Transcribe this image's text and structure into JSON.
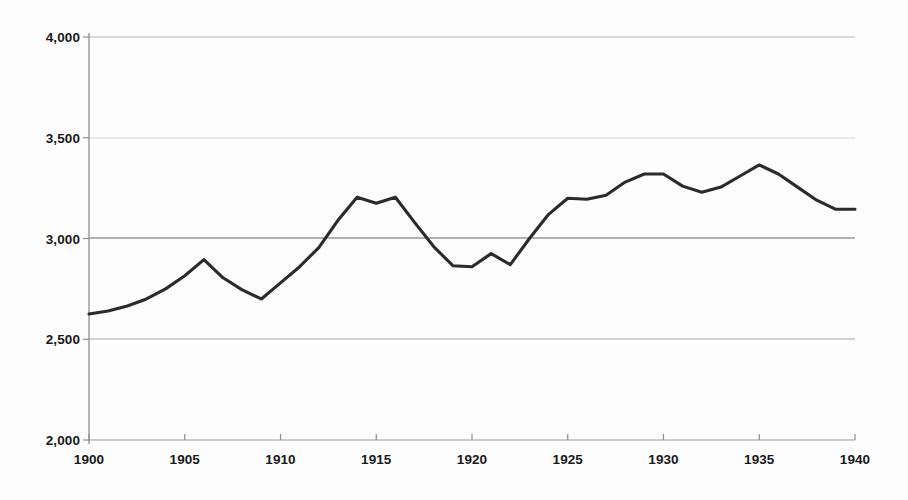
{
  "chart_data": {
    "type": "line",
    "title": "",
    "subtitle": "",
    "xlabel": "",
    "ylabel": "",
    "xlim": [
      1900,
      1940
    ],
    "ylim": [
      2000,
      4000
    ],
    "grid": true,
    "legend": false,
    "legend_position": "none",
    "x_tick_labels": [
      "1900",
      "1905",
      "1910",
      "1915",
      "1920",
      "1925",
      "1930",
      "1935",
      "1940"
    ],
    "x_ticks": [
      1900,
      1905,
      1910,
      1915,
      1920,
      1925,
      1930,
      1935,
      1940
    ],
    "y_tick_labels": [
      "2,000",
      "2,500",
      "3,000",
      "3,500",
      "4,000"
    ],
    "y_ticks": [
      2000,
      2500,
      3000,
      3500,
      4000
    ],
    "series": [
      {
        "name": "series-1",
        "color": "#2b2a2c",
        "x": [
          1900,
          1901,
          1902,
          1903,
          1904,
          1905,
          1906,
          1907,
          1908,
          1909,
          1910,
          1911,
          1912,
          1913,
          1914,
          1915,
          1916,
          1917,
          1918,
          1919,
          1920,
          1921,
          1922,
          1923,
          1924,
          1925,
          1926,
          1927,
          1928,
          1929,
          1930,
          1931,
          1932,
          1933,
          1934,
          1935,
          1936,
          1937,
          1938,
          1939,
          1940
        ],
        "values": [
          2625,
          2640,
          2665,
          2700,
          2750,
          2815,
          2895,
          2805,
          2745,
          2700,
          2780,
          2860,
          2955,
          3090,
          3205,
          3175,
          3205,
          3080,
          2960,
          2865,
          2860,
          2925,
          2870,
          3000,
          3120,
          3200,
          3195,
          3215,
          3280,
          3320,
          3320,
          3260,
          3230,
          3255,
          3310,
          3365,
          3320,
          3255,
          3190,
          3145,
          3145
        ]
      }
    ]
  },
  "axes": {
    "y_axis_line_color": "#8c8c8e",
    "grid_color": "#a6a6a8",
    "grid_color_light": "#d8d8da",
    "tick_color": "#8c8c8e",
    "background": "#fdfdfd"
  }
}
